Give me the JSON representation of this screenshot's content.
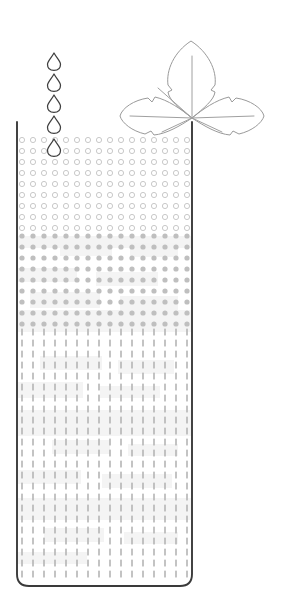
{
  "diagram": {
    "type": "schematic-illustration",
    "canvas": {
      "width": 288,
      "height": 611,
      "background": "#ffffff"
    },
    "colors": {
      "outline": "#3a3a3a",
      "leaf_stroke": "#9a9a9a",
      "vein_stroke": "#a0a0a0",
      "droplet_stroke": "#3f3f3f",
      "ring_stroke": "#c9c9c9",
      "dot_fill": "#bfbfbf",
      "dash_fill": "#b4b4b4",
      "band_shade": "#f2f2f2"
    },
    "elements": {
      "leaf": {
        "name": "trefoil-leaf",
        "lobes": 3,
        "lobe_names": [
          "top-lobe",
          "left-lobe",
          "right-lobe"
        ],
        "center_x": 192,
        "center_y": 118,
        "edge_style": "serrated",
        "veins": 6
      },
      "droplets": {
        "name": "falling-water-droplets",
        "count": 5,
        "column_x": 54,
        "y_positions": [
          53,
          74,
          95,
          116,
          139
        ],
        "width": 13,
        "height": 17
      },
      "container": {
        "name": "substrate-column",
        "left": 17,
        "right": 192,
        "top": 122,
        "bottom": 586,
        "corner_radius_bottom": 12,
        "open_top": true
      }
    },
    "layers": [
      {
        "id": "layer-rings",
        "label": "open-ring-zone",
        "pattern": "open-circles",
        "y_from": 140,
        "y_to": 236,
        "rows": 9,
        "symbol_radius": 2.6,
        "style": "stroke-only"
      },
      {
        "id": "layer-dots",
        "label": "filled-dot-zone",
        "pattern": "filled-dots",
        "y_from": 236,
        "y_to": 332,
        "rows": 9,
        "symbol_radius": 2.6,
        "style": "filled"
      },
      {
        "id": "layer-dashes",
        "label": "vertical-dash-zone",
        "pattern": "vertical-dashes",
        "y_from": 332,
        "y_to": 580,
        "rows": 23,
        "dash_width": 1.6,
        "dash_height": 7,
        "style": "filled"
      }
    ],
    "grid": {
      "columns": 16,
      "column_start_x": 22,
      "column_spacing": 11,
      "row_spacing": 11
    },
    "shade_bands": {
      "name": "mottled-shading-patches",
      "note": "faint light-gray rectangular patches overlaying the symbol grid",
      "patches": [
        {
          "x": 17,
          "y": 236,
          "w": 175,
          "h": 12
        },
        {
          "x": 60,
          "y": 240,
          "w": 52,
          "h": 16
        },
        {
          "x": 130,
          "y": 243,
          "w": 48,
          "h": 14
        },
        {
          "x": 17,
          "y": 268,
          "w": 60,
          "h": 14
        },
        {
          "x": 96,
          "y": 272,
          "w": 62,
          "h": 14
        },
        {
          "x": 30,
          "y": 292,
          "w": 70,
          "h": 16
        },
        {
          "x": 120,
          "y": 296,
          "w": 58,
          "h": 14
        },
        {
          "x": 17,
          "y": 310,
          "w": 175,
          "h": 22
        },
        {
          "x": 40,
          "y": 356,
          "w": 62,
          "h": 14
        },
        {
          "x": 118,
          "y": 360,
          "w": 56,
          "h": 14
        },
        {
          "x": 17,
          "y": 382,
          "w": 66,
          "h": 16
        },
        {
          "x": 100,
          "y": 386,
          "w": 60,
          "h": 12
        },
        {
          "x": 17,
          "y": 410,
          "w": 175,
          "h": 26
        },
        {
          "x": 52,
          "y": 440,
          "w": 58,
          "h": 14
        },
        {
          "x": 128,
          "y": 444,
          "w": 50,
          "h": 12
        },
        {
          "x": 17,
          "y": 470,
          "w": 64,
          "h": 14
        },
        {
          "x": 102,
          "y": 474,
          "w": 70,
          "h": 14
        },
        {
          "x": 17,
          "y": 498,
          "w": 175,
          "h": 22
        },
        {
          "x": 44,
          "y": 528,
          "w": 60,
          "h": 14
        },
        {
          "x": 124,
          "y": 532,
          "w": 54,
          "h": 12
        },
        {
          "x": 17,
          "y": 552,
          "w": 70,
          "h": 12
        }
      ]
    }
  }
}
